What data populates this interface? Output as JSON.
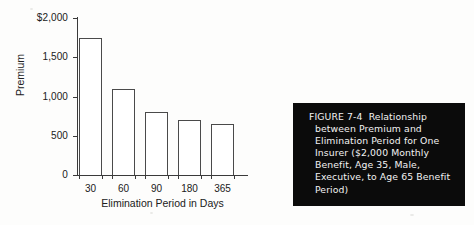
{
  "chart_data": {
    "type": "bar",
    "title": "",
    "xlabel": "Elimination Period in Days",
    "ylabel": "Premium",
    "categories": [
      "30",
      "60",
      "90",
      "180",
      "365"
    ],
    "values": [
      1750,
      1100,
      800,
      700,
      650
    ],
    "ylim": [
      0,
      2000
    ],
    "yticks": [
      0,
      500,
      1000,
      1500,
      2000
    ],
    "ytick_labels": [
      "0",
      "500",
      "1,000",
      "1,500",
      "$2,000"
    ],
    "grid": false,
    "legend": "none",
    "bar_fill": "#ffffff",
    "bar_edge": "#4a4a4a",
    "axis_color": "#3a3a3a"
  },
  "caption": {
    "text": "FIGURE 7-4  Relationship between Premium and Elimination Period for One Insurer ($2,000 Monthly Benefit, Age 35, Male, Executive, to Age 65 Benefit Period)",
    "background": "#0b0b0b",
    "color": "#f2f2f2"
  }
}
